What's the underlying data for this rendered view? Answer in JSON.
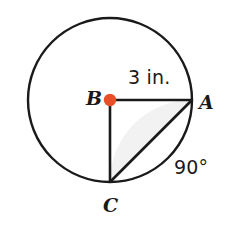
{
  "figure": {
    "kind": "circle-with-central-angle",
    "background_color": "#FFFFFF",
    "stroke_color": "#1A1A1A",
    "center_dot_color": "#E8502A",
    "segment_fill_color": "#F2F2F2",
    "circle": {
      "center_label": "B",
      "center_x": 110,
      "center_y": 100,
      "radius_px": 82
    },
    "points": [
      {
        "name": "point-b-center",
        "label": "B",
        "x": 110,
        "y": 100
      },
      {
        "name": "point-a",
        "label": "A",
        "x": 192,
        "y": 100
      },
      {
        "name": "point-c",
        "label": "C",
        "x": 110,
        "y": 182
      }
    ],
    "labels": {
      "center": "B",
      "point_a": "A",
      "point_c": "C",
      "radius_measure": "3 in.",
      "angle_measure": "90°"
    },
    "segments": [
      {
        "name": "radius-b-to-a",
        "from": "B",
        "to": "A",
        "measure": "3 in."
      },
      {
        "name": "radius-b-to-c",
        "from": "B",
        "to": "C",
        "measure": ""
      },
      {
        "name": "chord-a-to-c",
        "from": "A",
        "to": "C",
        "measure": ""
      }
    ],
    "angle": {
      "vertex": "B",
      "rays": [
        "A",
        "C"
      ],
      "value": "90°"
    },
    "shaded_region": {
      "name": "circular-segment-ac",
      "description": "segment between chord AC and minor arc AC"
    }
  }
}
